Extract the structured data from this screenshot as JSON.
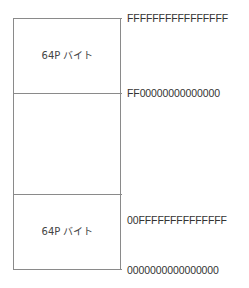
{
  "diagram": {
    "type": "memory-map",
    "segments": [
      {
        "label": "64P バイト"
      },
      {
        "label": ""
      },
      {
        "label": "64P バイト"
      }
    ],
    "addresses": [
      "FFFFFFFFFFFFFFFF",
      "FF00000000000000",
      "00FFFFFFFFFFFFFF",
      "0000000000000000"
    ]
  }
}
